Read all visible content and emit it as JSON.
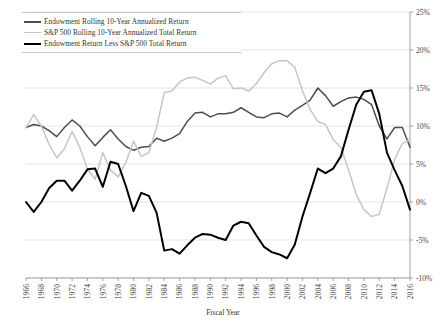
{
  "chart_data": {
    "type": "line",
    "title": "",
    "xlabel": "Fiscal Year",
    "ylabel": "",
    "grid": true,
    "legend_position": "top-left",
    "xlim": [
      1966,
      2016
    ],
    "ylim": [
      -0.1,
      0.25
    ],
    "ytick_labels": [
      "25%",
      "20%",
      "15%",
      "10%",
      "5%",
      "0%",
      "-5%",
      "-10%"
    ],
    "ytick_values": [
      0.25,
      0.2,
      0.15,
      0.1,
      0.05,
      0.0,
      -0.05,
      -0.1
    ],
    "xtick_labels": [
      "1966",
      "1968",
      "1970",
      "1972",
      "1974",
      "1976",
      "1978",
      "1980",
      "1982",
      "1984",
      "1986",
      "1988",
      "1990",
      "1992",
      "1994",
      "1996",
      "1998",
      "2000",
      "2002",
      "2004",
      "2006",
      "2008",
      "2010",
      "2012",
      "2014",
      "2016"
    ],
    "x": [
      1966,
      1967,
      1968,
      1969,
      1970,
      1971,
      1972,
      1973,
      1974,
      1975,
      1976,
      1977,
      1978,
      1979,
      1980,
      1981,
      1982,
      1983,
      1984,
      1985,
      1986,
      1987,
      1988,
      1989,
      1990,
      1991,
      1992,
      1993,
      1994,
      1995,
      1996,
      1997,
      1998,
      1999,
      2000,
      2001,
      2002,
      2003,
      2004,
      2005,
      2006,
      2007,
      2008,
      2009,
      2010,
      2011,
      2012,
      2013,
      2014,
      2015,
      2016
    ],
    "series": [
      {
        "name": "Endowment Rolling 10-Year Annualized Return",
        "color": "#4d4d4d",
        "width": 1.5,
        "values": [
          0.098,
          0.102,
          0.1,
          0.094,
          0.086,
          0.098,
          0.108,
          0.1,
          0.086,
          0.074,
          0.085,
          0.095,
          0.083,
          0.073,
          0.068,
          0.072,
          0.073,
          0.084,
          0.08,
          0.084,
          0.09,
          0.106,
          0.117,
          0.118,
          0.112,
          0.116,
          0.116,
          0.118,
          0.124,
          0.118,
          0.112,
          0.111,
          0.116,
          0.117,
          0.112,
          0.121,
          0.127,
          0.134,
          0.15,
          0.14,
          0.126,
          0.132,
          0.137,
          0.138,
          0.135,
          0.128,
          0.1,
          0.083,
          0.098,
          0.098,
          0.072
        ]
      },
      {
        "name": "S&P 500 Rolling 10-Year Annualized Total Return",
        "color": "#c6c6c6",
        "width": 1.5,
        "values": [
          0.098,
          0.115,
          0.1,
          0.076,
          0.058,
          0.07,
          0.093,
          0.072,
          0.043,
          0.03,
          0.065,
          0.042,
          0.033,
          0.052,
          0.08,
          0.06,
          0.065,
          0.098,
          0.144,
          0.146,
          0.158,
          0.163,
          0.164,
          0.16,
          0.155,
          0.163,
          0.166,
          0.149,
          0.15,
          0.146,
          0.156,
          0.17,
          0.182,
          0.186,
          0.186,
          0.177,
          0.146,
          0.122,
          0.106,
          0.102,
          0.082,
          0.072,
          0.042,
          0.01,
          -0.01,
          -0.019,
          -0.016,
          0.018,
          0.056,
          0.077,
          0.082
        ]
      },
      {
        "name": "Endowment Return Less S&P 500 Total Return",
        "color": "#000000",
        "width": 2.0,
        "values": [
          0.0,
          -0.013,
          0.0,
          0.018,
          0.028,
          0.028,
          0.015,
          0.028,
          0.043,
          0.044,
          0.02,
          0.053,
          0.05,
          0.021,
          -0.012,
          0.012,
          0.008,
          -0.014,
          -0.064,
          -0.062,
          -0.068,
          -0.057,
          -0.047,
          -0.042,
          -0.043,
          -0.047,
          -0.05,
          -0.031,
          -0.026,
          -0.028,
          -0.044,
          -0.059,
          -0.066,
          -0.069,
          -0.074,
          -0.056,
          -0.019,
          0.012,
          0.044,
          0.038,
          0.044,
          0.06,
          0.095,
          0.128,
          0.145,
          0.147,
          0.116,
          0.065,
          0.042,
          0.021,
          -0.01
        ]
      }
    ]
  },
  "legend": {
    "items": [
      {
        "label": "Endowment Rolling 10-Year Annualized Return",
        "color": "#4d4d4d",
        "thickness": "2px"
      },
      {
        "label": "S&P 500 Rolling 10-Year Annualized Total Return",
        "color": "#c6c6c6",
        "thickness": "1.6px"
      },
      {
        "label": "Endowment Return Less S&P 500 Total Return",
        "color": "#000000",
        "thickness": "2.4px"
      }
    ]
  },
  "axis": {
    "x_title": "Fiscal Year"
  }
}
